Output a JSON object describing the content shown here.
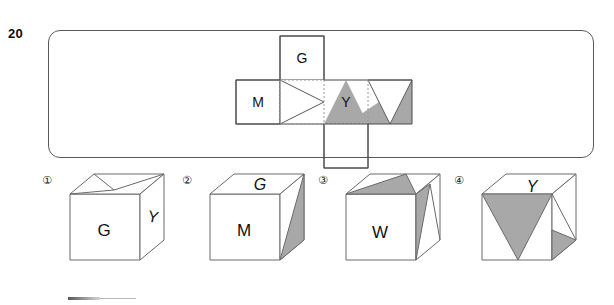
{
  "question": {
    "number": "20",
    "frame": {
      "shape": "rounded-rectangle",
      "border_color": "#5a5a5a"
    }
  },
  "net": {
    "description": "Cube net cross layout with lettered and shaded faces",
    "cell_size": 44,
    "colors": {
      "outline": "#4a4a4a",
      "fold_line": "#9a9a9a",
      "shade_fill": "#a8a8a8",
      "white_fill": "#ffffff"
    },
    "cells": [
      {
        "id": "top",
        "label": "G",
        "col": 2,
        "row": 0,
        "marking": "none"
      },
      {
        "id": "left",
        "label": "M",
        "col": 1,
        "row": 1,
        "marking": "none"
      },
      {
        "id": "center",
        "label": "",
        "col": 2,
        "row": 1,
        "marking": "white-triangle-right"
      },
      {
        "id": "right",
        "label": "Y",
        "col": 3,
        "row": 1,
        "marking": "none"
      },
      {
        "id": "far-right",
        "label": "",
        "col": 4,
        "row": 1,
        "marking": "white-v-triangle-with-gray-corner"
      },
      {
        "id": "bottom",
        "label": "",
        "col": 3,
        "row": 2,
        "marking": "gray-triangle-up"
      }
    ]
  },
  "options": [
    {
      "number": "①",
      "front_label": "G",
      "right_label": "Y",
      "top_marking": "white-v-outline",
      "front_marking": "none",
      "right_marking": "none"
    },
    {
      "number": "②",
      "front_label": "M",
      "top_label": "G",
      "top_label_style": "italic",
      "top_marking": "none",
      "front_marking": "none",
      "right_marking": "gray-triangle"
    },
    {
      "number": "③",
      "front_label": "W",
      "front_label_note": "upside-down M",
      "top_marking": "gray-triangle",
      "front_marking": "none",
      "right_marking": "gray-triangle"
    },
    {
      "number": "④",
      "top_label": "Y",
      "top_label_style": "italic",
      "top_marking": "none",
      "front_marking": "gray-inverted-triangle",
      "right_marking": "gray-small-triangle"
    }
  ]
}
